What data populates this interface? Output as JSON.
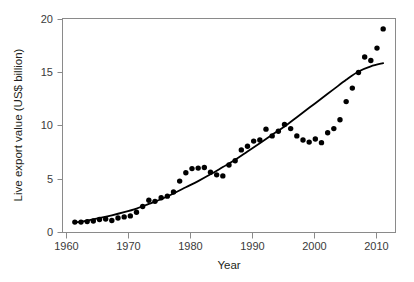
{
  "chart_data": {
    "type": "scatter",
    "title": "",
    "xlabel": "Year",
    "ylabel": "Live export value (US$ billion)",
    "xlim": [
      1959,
      2013
    ],
    "ylim": [
      0,
      20.6
    ],
    "xticks": [
      1960,
      1970,
      1980,
      1990,
      2000,
      2010
    ],
    "xtick_labels": [
      "1960",
      "1970",
      "1980",
      "1990",
      "2000",
      "2010"
    ],
    "yticks": [
      0,
      5,
      10,
      15,
      20
    ],
    "ytick_labels": [
      "0",
      "5",
      "10",
      "15",
      "20"
    ],
    "grid": false,
    "legend": null,
    "point_color": "#000000",
    "line_color": "#000000",
    "frame_color": "#8a8a8a",
    "series": [
      {
        "name": "Live export value",
        "marker": "filled-circle",
        "x": [
          1961,
          1962,
          1963,
          1964,
          1965,
          1966,
          1967,
          1968,
          1969,
          1970,
          1971,
          1972,
          1973,
          1974,
          1975,
          1976,
          1977,
          1978,
          1979,
          1980,
          1981,
          1982,
          1983,
          1984,
          1985,
          1986,
          1987,
          1988,
          1989,
          1990,
          1991,
          1992,
          1993,
          1994,
          1995,
          1996,
          1997,
          1998,
          1999,
          2000,
          2001,
          2002,
          2003,
          2004,
          2005,
          2006,
          2007,
          2008,
          2009,
          2010,
          2011
        ],
        "y": [
          1.0,
          1.0,
          1.05,
          1.1,
          1.25,
          1.3,
          1.15,
          1.4,
          1.5,
          1.6,
          1.95,
          2.5,
          3.1,
          3.0,
          3.35,
          3.5,
          3.9,
          4.95,
          5.75,
          6.15,
          6.2,
          6.25,
          5.8,
          5.55,
          5.45,
          6.5,
          6.9,
          7.95,
          8.3,
          8.8,
          8.9,
          9.95,
          9.3,
          9.75,
          10.4,
          10.0,
          9.3,
          8.9,
          8.7,
          9.0,
          8.65,
          9.6,
          10.0,
          10.85,
          12.6,
          13.9,
          15.4,
          16.9,
          16.55,
          17.75,
          19.6
        ]
      }
    ],
    "fit_curve": {
      "name": "exponential trend line",
      "x": [
        1961,
        1963,
        1965,
        1967,
        1969,
        1971,
        1973,
        1975,
        1977,
        1979,
        1981,
        1983,
        1985,
        1987,
        1989,
        1991,
        1993,
        1995,
        1997,
        1999,
        2001,
        2003,
        2005,
        2007,
        2009,
        2011
      ],
      "y": [
        0.95,
        1.15,
        1.4,
        1.65,
        1.95,
        2.3,
        2.75,
        3.2,
        3.75,
        4.35,
        4.95,
        5.6,
        6.3,
        7.0,
        7.8,
        8.6,
        9.4,
        10.2,
        11.1,
        12.0,
        12.9,
        13.8,
        14.7,
        15.5,
        16.0,
        16.3
      ]
    }
  },
  "axis": {
    "y_title": "Live export value (US$ billion)",
    "x_title": "Year"
  }
}
